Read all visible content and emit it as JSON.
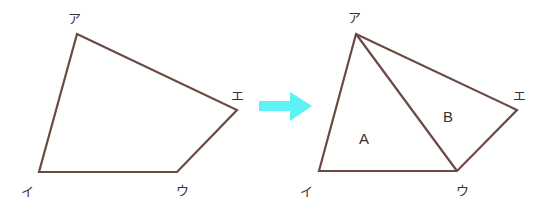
{
  "colors": {
    "stroke": "#6b4a44",
    "arrow": "#5ff2f5",
    "label": "#3a3030"
  },
  "left_figure": {
    "vertices": {
      "a": {
        "label": "ア"
      },
      "i": {
        "label": "イ"
      },
      "u": {
        "label": "ウ"
      },
      "e": {
        "label": "エ"
      }
    }
  },
  "arrow": {
    "direction": "right"
  },
  "right_figure": {
    "vertices": {
      "a": {
        "label": "ア"
      },
      "i": {
        "label": "イ"
      },
      "u": {
        "label": "ウ"
      },
      "e": {
        "label": "エ"
      }
    },
    "diagonal": "ア-ウ",
    "regions": [
      {
        "label": "A"
      },
      {
        "label": "B"
      }
    ]
  }
}
